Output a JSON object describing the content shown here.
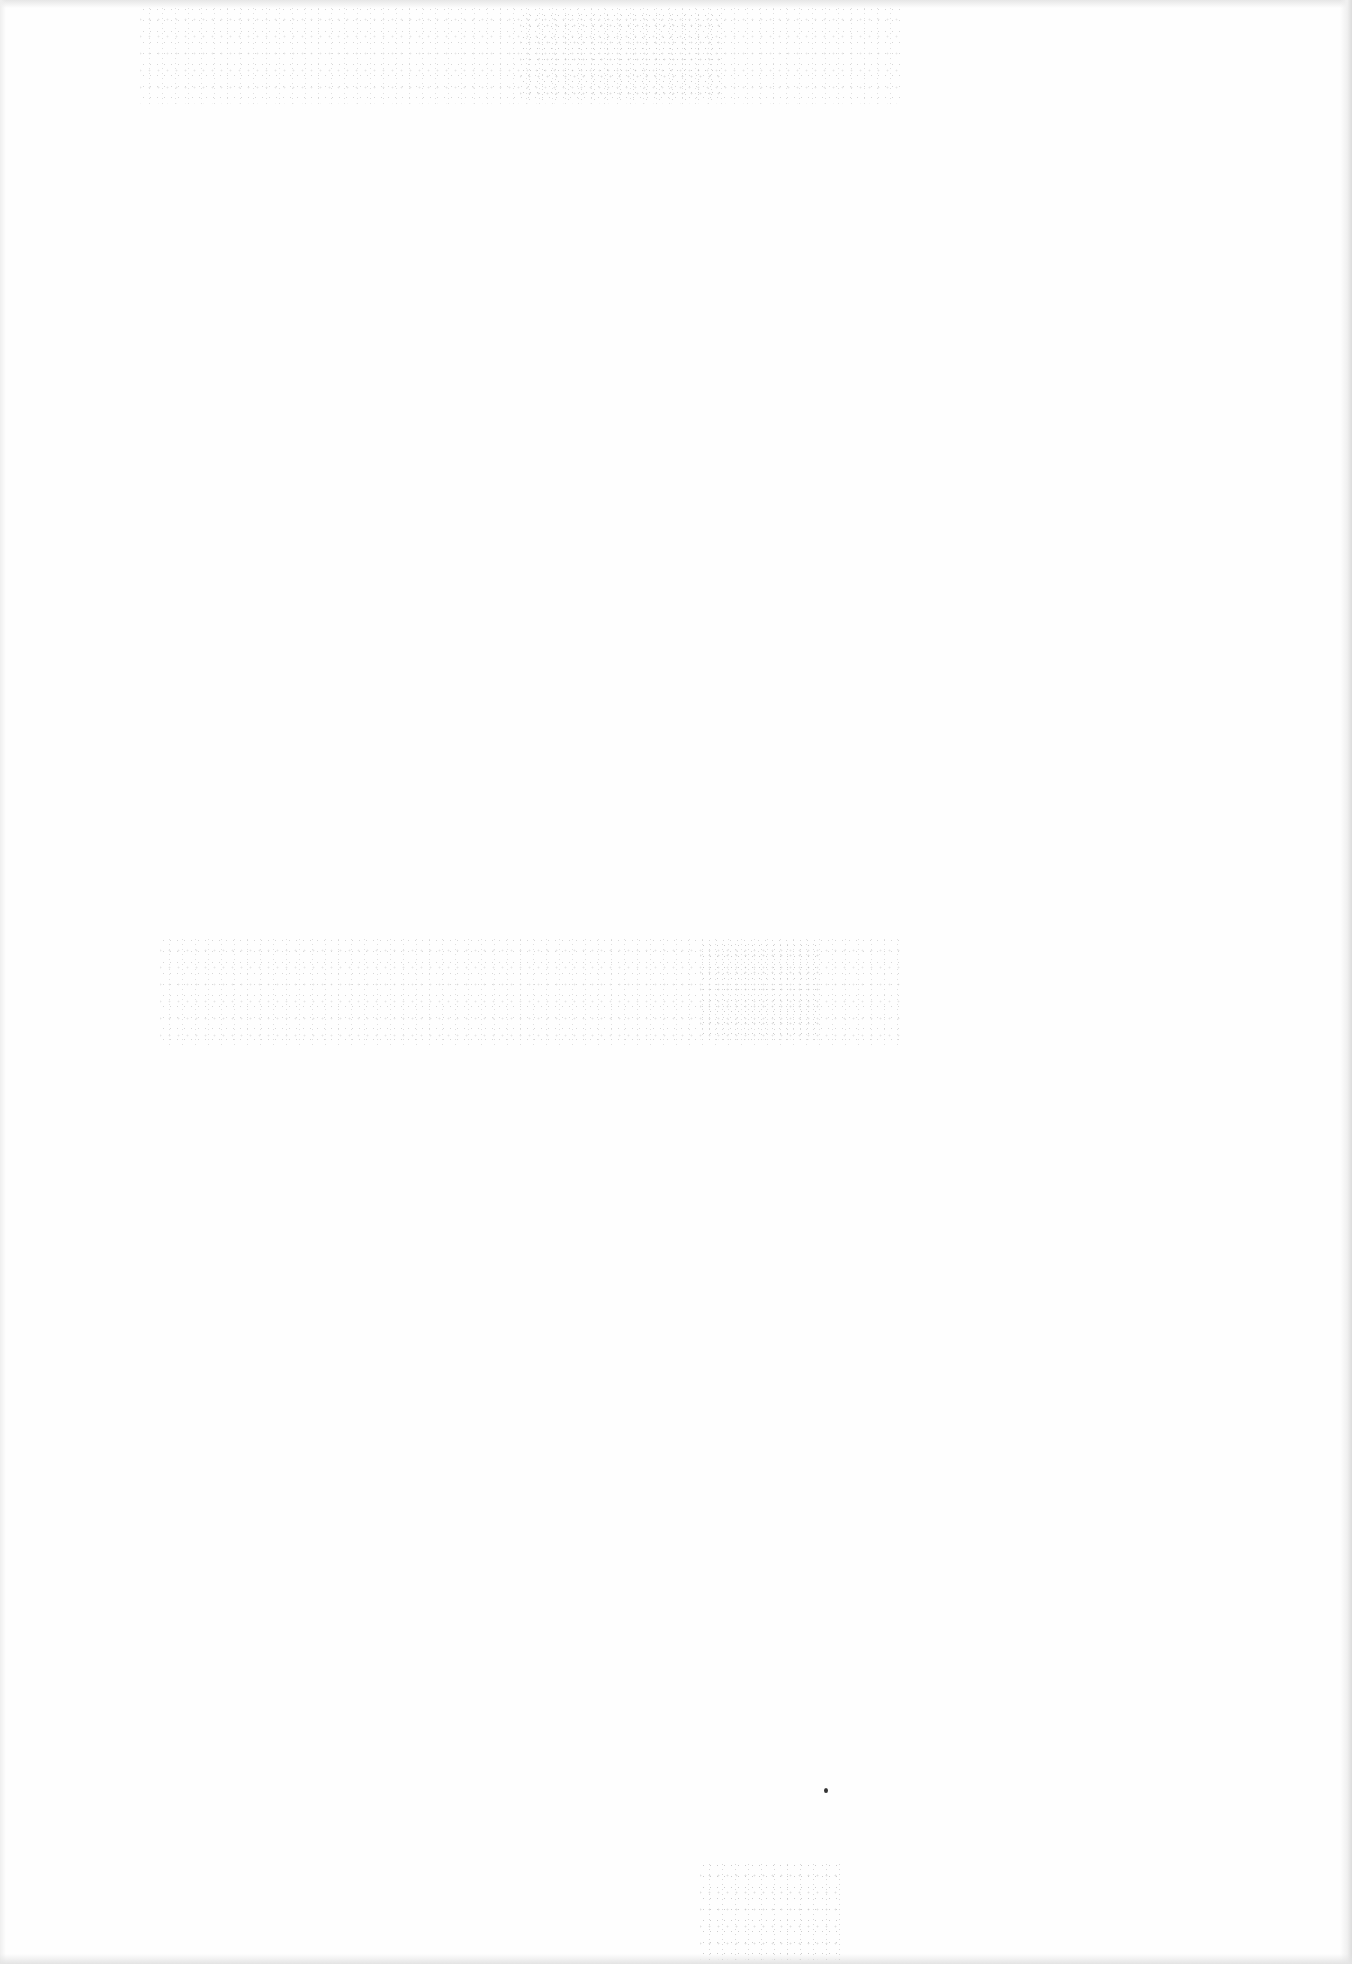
{
  "document": {
    "type": "blank scanned page",
    "text_content": "",
    "colors": {
      "paper": "#fefefe",
      "edge_shadow": "#dcdcdc",
      "noise": "#b8b8b8",
      "speck": "#333333"
    }
  }
}
